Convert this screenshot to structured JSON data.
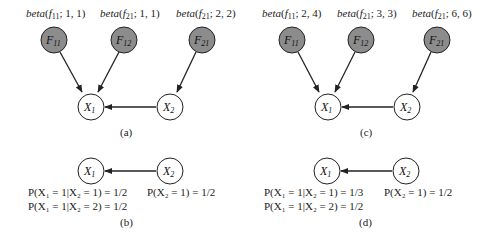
{
  "panels": {
    "a": {
      "caption": "(a)",
      "priors": [
        {
          "fn": "beta",
          "arg": "f",
          "sub": "11",
          "params": "; 1, 1)"
        },
        {
          "fn": "beta",
          "arg": "f",
          "sub": "21",
          "params": "; 1, 1)"
        },
        {
          "fn": "beta",
          "arg": "f",
          "sub": "21",
          "params": "; 2, 2)"
        }
      ],
      "nodes": {
        "f11": {
          "var": "F",
          "sub": "11"
        },
        "f12": {
          "var": "F",
          "sub": "12"
        },
        "f21": {
          "var": "F",
          "sub": "21"
        },
        "x1": {
          "var": "X",
          "sub": "1"
        },
        "x2": {
          "var": "X",
          "sub": "2"
        }
      }
    },
    "b": {
      "caption": "(b)",
      "nodes": {
        "x1": {
          "var": "X",
          "sub": "1"
        },
        "x2": {
          "var": "X",
          "sub": "2"
        }
      },
      "probs": {
        "p1": "P(X₁ = 1|X₂ = 1) = 1/2",
        "p2": "P(X₁ = 1|X₂ = 2) = 1/2",
        "p3": "P(X₂ = 1) = 1/2"
      }
    },
    "c": {
      "caption": "(c)",
      "priors": [
        {
          "fn": "beta",
          "arg": "f",
          "sub": "11",
          "params": "; 2, 4)"
        },
        {
          "fn": "beta",
          "arg": "f",
          "sub": "21",
          "params": "; 3, 3)"
        },
        {
          "fn": "beta",
          "arg": "f",
          "sub": "21",
          "params": "; 6, 6)"
        }
      ],
      "nodes": {
        "f11": {
          "var": "F",
          "sub": "11"
        },
        "f12": {
          "var": "F",
          "sub": "12"
        },
        "f21": {
          "var": "F",
          "sub": "21"
        },
        "x1": {
          "var": "X",
          "sub": "1"
        },
        "x2": {
          "var": "X",
          "sub": "2"
        }
      }
    },
    "d": {
      "caption": "(d)",
      "nodes": {
        "x1": {
          "var": "X",
          "sub": "1"
        },
        "x2": {
          "var": "X",
          "sub": "2"
        }
      },
      "probs": {
        "p1": "P(X₁ = 1|X₂ = 1) = 1/3",
        "p2": "P(X₁ = 1|X₂ = 2) = 1/2",
        "p3": "P(X₂ = 1) = 1/2"
      }
    }
  },
  "colors": {
    "parameter_node_fill": "#8c8c8c",
    "variable_node_fill": "#ffffff",
    "stroke": "#222222"
  }
}
